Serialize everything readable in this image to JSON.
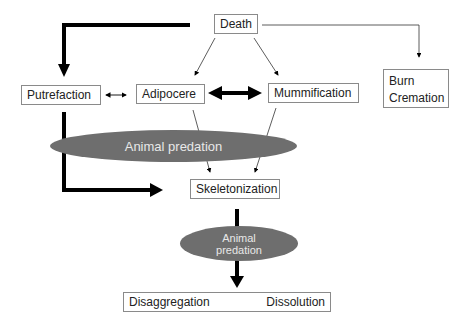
{
  "diagram": {
    "nodes": {
      "death": "Death",
      "putrefaction": "Putrefaction",
      "adipocere": "Adipocere",
      "mummification": "Mummification",
      "burn": "Burn",
      "cremation": "Cremation",
      "skeletonization": "Skeletonization",
      "disaggregation": "Disaggregation",
      "dissolution": "Dissolution"
    },
    "ellipses": {
      "animal_predation_1": "Animal predation",
      "animal_predation_2_line1": "Animal",
      "animal_predation_2_line2": "predation"
    },
    "colors": {
      "ellipse_fill": "#6e6e6e",
      "ellipse_text": "#e8e8e8",
      "arrow": "#000000",
      "box_border": "#8a8a8a"
    },
    "edges": [
      {
        "from": "Death",
        "to": "Putrefaction",
        "style": "thick"
      },
      {
        "from": "Death",
        "to": "Adipocere",
        "style": "thin"
      },
      {
        "from": "Death",
        "to": "Mummification",
        "style": "thin"
      },
      {
        "from": "Death",
        "to": "Burn/Cremation",
        "style": "thin"
      },
      {
        "from": "Putrefaction",
        "to": "Adipocere",
        "style": "thin-bidirectional"
      },
      {
        "from": "Adipocere",
        "to": "Mummification",
        "style": "thick-bidirectional"
      },
      {
        "from": "Putrefaction",
        "to": "Skeletonization",
        "style": "thick"
      },
      {
        "from": "Adipocere",
        "to": "Skeletonization",
        "style": "thin"
      },
      {
        "from": "Mummification",
        "to": "Skeletonization",
        "style": "thin"
      },
      {
        "from": "Skeletonization",
        "to": "Disaggregation",
        "style": "thick"
      },
      {
        "from": "Disaggregation",
        "to": "Dissolution",
        "style": "thin"
      }
    ]
  }
}
